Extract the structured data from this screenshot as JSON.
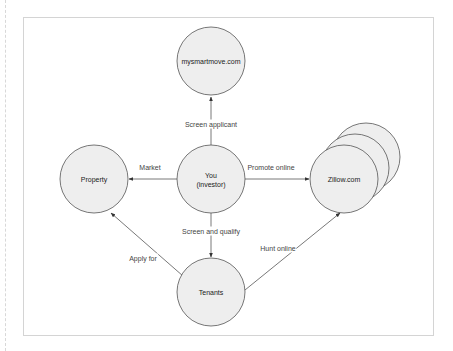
{
  "diagram": {
    "nodes": [
      {
        "id": "mysmartmove",
        "label": "mysmartmove.com",
        "cx": 211,
        "cy": 61
      },
      {
        "id": "property",
        "label": "Property",
        "cx": 94,
        "cy": 179
      },
      {
        "id": "you",
        "label": "You",
        "sublabel": "(investor)",
        "cx": 211,
        "cy": 179
      },
      {
        "id": "zillow",
        "label": "Zillow.com",
        "cx": 344,
        "cy": 179,
        "stacked": true
      },
      {
        "id": "tenants",
        "label": "Tenants",
        "cx": 211,
        "cy": 292
      }
    ],
    "edges": [
      {
        "from": "you",
        "to": "mysmartmove",
        "label": "Screen applicant"
      },
      {
        "from": "you",
        "to": "property",
        "label": "Market"
      },
      {
        "from": "you",
        "to": "zillow",
        "label": "Promote online"
      },
      {
        "from": "you",
        "to": "tenants",
        "label": "Screen and qualify"
      },
      {
        "from": "tenants",
        "to": "property",
        "label": "Apply for"
      },
      {
        "from": "tenants",
        "to": "zillow",
        "label": "Hunt online"
      }
    ],
    "colors": {
      "node_fill": "#eeeeee",
      "node_stroke": "#555555",
      "edge_stroke": "#555555",
      "frame": "#d4d4d4"
    }
  }
}
